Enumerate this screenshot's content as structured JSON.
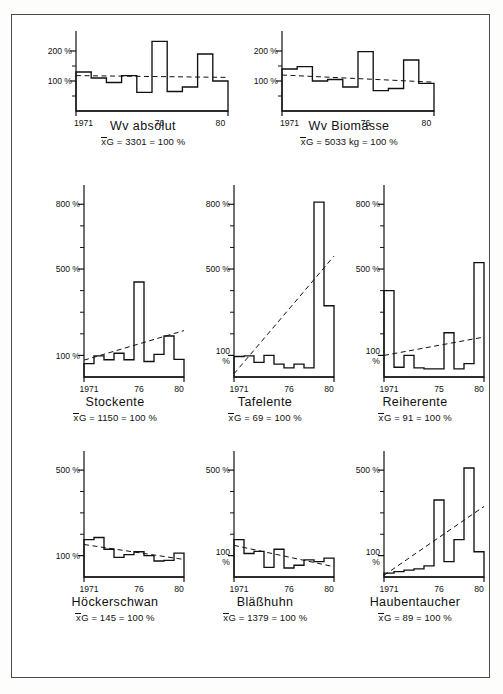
{
  "figure": {
    "panel_count": 9,
    "x_tick_labels": [
      "1971",
      "76",
      "80"
    ],
    "x_tick_labels_reiherente": [
      "1971",
      "75",
      "80"
    ],
    "x_tick_labels_haubentaucher": [
      "1971",
      "76",
      "80"
    ],
    "percent_symbol": "%",
    "mean_prefix": "x",
    "mean_suffix": "G",
    "trend_style": "dashed"
  },
  "chart_data": [
    {
      "type": "bar",
      "title": "Wv absolut",
      "annotation": "xG = 3301 = 100 %",
      "mean_value": 3301,
      "mean_unit": "",
      "ylabel": "",
      "xlabel": "",
      "ytick_labels": [
        "100 %",
        "200 %"
      ],
      "yticks": [
        100,
        200
      ],
      "ylim": [
        0,
        260
      ],
      "baseline": 40,
      "x": [
        1971,
        1972,
        1973,
        1974,
        1975,
        1976,
        1977,
        1978,
        1979,
        1980
      ],
      "categories": [
        "1971",
        "1972",
        "1973",
        "1974",
        "1975",
        "1976",
        "1977",
        "1978",
        "1979",
        "1980"
      ],
      "values": [
        130,
        110,
        95,
        118,
        62,
        232,
        65,
        80,
        190,
        100
      ],
      "trend": [
        118,
        112
      ],
      "grid": false,
      "legend": "none"
    },
    {
      "type": "bar",
      "title": "Wv Biomasse",
      "annotation": "xG = 5033 kg = 100 %",
      "mean_value": 5033,
      "mean_unit": "kg",
      "ylabel": "",
      "xlabel": "",
      "ytick_labels": [
        "100 %",
        "200 %"
      ],
      "yticks": [
        100,
        200
      ],
      "ylim": [
        0,
        260
      ],
      "baseline": 40,
      "x": [
        1971,
        1972,
        1973,
        1974,
        1975,
        1976,
        1977,
        1978,
        1979,
        1980
      ],
      "categories": [
        "1971",
        "1972",
        "1973",
        "1974",
        "1975",
        "1976",
        "1977",
        "1978",
        "1979",
        "1980"
      ],
      "values": [
        140,
        148,
        100,
        105,
        80,
        198,
        68,
        75,
        170,
        92
      ],
      "trend": [
        120,
        96
      ],
      "grid": false,
      "legend": "none"
    },
    {
      "type": "bar",
      "title": "Stockente",
      "annotation": "xG = 1150 = 100 %",
      "mean_value": 1150,
      "mean_unit": "",
      "ylabel": "",
      "xlabel": "",
      "ytick_labels": [
        "100 %",
        "500 %",
        "800 %"
      ],
      "yticks": [
        100,
        500,
        800
      ],
      "ylim": [
        0,
        880
      ],
      "baseline": 55,
      "x": [
        1971,
        1972,
        1973,
        1974,
        1975,
        1976,
        1977,
        1978,
        1979,
        1980
      ],
      "categories": [
        "1971",
        "1972",
        "1973",
        "1974",
        "1975",
        "1976",
        "1977",
        "1978",
        "1979",
        "1980"
      ],
      "values": [
        62,
        98,
        80,
        110,
        80,
        440,
        72,
        105,
        190,
        82
      ],
      "trend": [
        78,
        215
      ],
      "grid": false,
      "legend": "none"
    },
    {
      "type": "bar",
      "title": "Tafelente",
      "annotation": "xG = 69 = 100 %",
      "mean_value": 69,
      "mean_unit": "",
      "ylabel": "",
      "xlabel": "",
      "ytick_labels": [
        "100 %",
        "500 %",
        "800 %"
      ],
      "yticks": [
        100,
        500,
        800
      ],
      "ylim": [
        0,
        880
      ],
      "baseline": 20,
      "x": [
        1971,
        1972,
        1973,
        1974,
        1975,
        1976,
        1977,
        1978,
        1979,
        1980
      ],
      "categories": [
        "1971",
        "1972",
        "1973",
        "1974",
        "1975",
        "1976",
        "1977",
        "1978",
        "1979",
        "1980"
      ],
      "values": [
        95,
        98,
        68,
        100,
        60,
        42,
        60,
        42,
        810,
        330
      ],
      "trend": [
        15,
        560
      ],
      "grid": false,
      "legend": "none"
    },
    {
      "type": "bar",
      "title": "Reiherente",
      "annotation": "xG = 91 = 100 %",
      "mean_value": 91,
      "mean_unit": "",
      "ylabel": "",
      "xlabel": "",
      "ytick_labels": [
        "100 %",
        "500 %",
        "800 %"
      ],
      "yticks": [
        100,
        500,
        800
      ],
      "ylim": [
        0,
        880
      ],
      "baseline": 30,
      "x": [
        1971,
        1972,
        1973,
        1974,
        1975,
        1976,
        1977,
        1978,
        1979,
        1980
      ],
      "categories": [
        "1971",
        "1972",
        "1973",
        "1974",
        "1975",
        "1976",
        "1977",
        "1978",
        "1979",
        "1980"
      ],
      "values": [
        400,
        45,
        100,
        42,
        38,
        38,
        205,
        38,
        62,
        530
      ],
      "trend": [
        100,
        185
      ],
      "grid": false,
      "legend": "none"
    },
    {
      "type": "bar",
      "title": "Höckerschwan",
      "annotation": "xG = 145 = 100 %",
      "mean_value": 145,
      "mean_unit": "",
      "ylabel": "",
      "xlabel": "",
      "ytick_labels": [
        "100 %",
        "500 %"
      ],
      "yticks": [
        100,
        500
      ],
      "ylim": [
        0,
        580
      ],
      "baseline": 45,
      "x": [
        1971,
        1972,
        1973,
        1974,
        1975,
        1976,
        1977,
        1978,
        1979,
        1980
      ],
      "categories": [
        "1971",
        "1972",
        "1973",
        "1974",
        "1975",
        "1976",
        "1977",
        "1978",
        "1979",
        "1980"
      ],
      "values": [
        175,
        185,
        130,
        92,
        105,
        118,
        100,
        75,
        78,
        112
      ],
      "trend": [
        152,
        82
      ],
      "grid": false,
      "legend": "none"
    },
    {
      "type": "bar",
      "title": "Bläßhuhn",
      "annotation": "xG = 1379 = 100 %",
      "mean_value": 1379,
      "mean_unit": "",
      "ylabel": "",
      "xlabel": "",
      "ytick_labels": [
        "100 %",
        "500 %"
      ],
      "yticks": [
        100,
        500
      ],
      "ylim": [
        0,
        580
      ],
      "baseline": 20,
      "x": [
        1971,
        1972,
        1973,
        1974,
        1975,
        1976,
        1977,
        1978,
        1979,
        1980
      ],
      "categories": [
        "1971",
        "1972",
        "1973",
        "1974",
        "1975",
        "1976",
        "1977",
        "1978",
        "1979",
        "1980"
      ],
      "values": [
        175,
        110,
        120,
        45,
        130,
        42,
        55,
        80,
        72,
        88
      ],
      "trend": [
        148,
        48
      ],
      "grid": false,
      "legend": "none"
    },
    {
      "type": "bar",
      "title": "Haubentaucher",
      "annotation": "xG = 89 = 100 %",
      "mean_value": 89,
      "mean_unit": "",
      "ylabel": "",
      "xlabel": "",
      "ytick_labels": [
        "100 %",
        "500 %"
      ],
      "yticks": [
        100,
        500
      ],
      "ylim": [
        0,
        580
      ],
      "baseline": 8,
      "x": [
        1971,
        1972,
        1973,
        1974,
        1975,
        1976,
        1977,
        1978,
        1979,
        1980
      ],
      "categories": [
        "1971",
        "1972",
        "1973",
        "1974",
        "1975",
        "1976",
        "1977",
        "1978",
        "1979",
        "1980"
      ],
      "values": [
        18,
        25,
        32,
        38,
        52,
        360,
        72,
        175,
        510,
        118
      ],
      "trend": [
        8,
        330
      ],
      "grid": false,
      "legend": "none"
    }
  ],
  "panels": [
    {
      "key": "wv_absolut",
      "title": "Wv absolut",
      "mean_text": "G = 3301 = 100 %"
    },
    {
      "key": "wv_biomasse",
      "title": "Wv  Biomasse",
      "mean_text": "G = 5033 kg = 100 %"
    },
    {
      "key": "stockente",
      "title": "Stockente",
      "mean_text": "G = 1150 = 100 %"
    },
    {
      "key": "tafelente",
      "title": "Tafelente",
      "mean_text": "G = 69 = 100 %"
    },
    {
      "key": "reiherente",
      "title": "Reiherente",
      "mean_text": "G = 91 = 100 %"
    },
    {
      "key": "hoeckerschwan",
      "title": "Höckerschwan",
      "mean_text": "G = 145 = 100 %"
    },
    {
      "key": "blaesshuhn",
      "title": "Bläßhuhn",
      "mean_text": "G = 1379 = 100 %"
    },
    {
      "key": "haubentaucher",
      "title": "Haubentaucher",
      "mean_text": "G = 89 = 100 %"
    }
  ]
}
